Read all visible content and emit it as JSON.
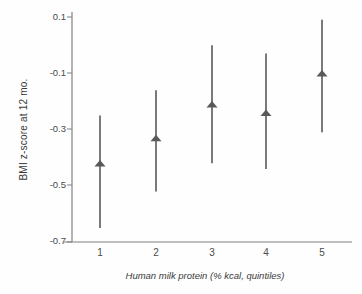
{
  "chart_data": {
    "type": "scatter",
    "title": "",
    "xlabel": "Human milk protein  (% kcal, quintiles)",
    "ylabel": "BMI z-score at 12 mo.",
    "categories": [
      "1",
      "2",
      "3",
      "4",
      "5"
    ],
    "xticklabels": [
      "1",
      "2",
      "3",
      "4",
      "5"
    ],
    "yticklabels": [
      "0.1",
      "-0.1",
      "-0.3",
      "-0.5",
      "-0.7"
    ],
    "ytickvalues": [
      0.1,
      -0.1,
      -0.3,
      -0.5,
      -0.7
    ],
    "ylim": [
      -0.7,
      0.1
    ],
    "grid": false,
    "legend": null,
    "marker": "triangle-up",
    "errorbar": "vertical-line",
    "series": [
      {
        "name": "BMI z-score at 12 mo.",
        "values": [
          -0.42,
          -0.33,
          -0.21,
          -0.24,
          -0.1
        ],
        "error_low": [
          -0.65,
          -0.52,
          -0.42,
          -0.44,
          -0.31
        ],
        "error_high": [
          -0.25,
          -0.16,
          0.0,
          -0.03,
          0.09
        ]
      }
    ],
    "colors": {
      "marker": "#595959",
      "errorbar": "#595959",
      "axis": "#808080",
      "text": "#3a3a3a",
      "background": "#fefefe"
    }
  }
}
